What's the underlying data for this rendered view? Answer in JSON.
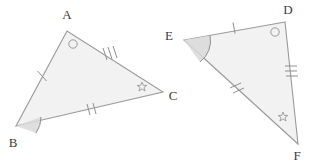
{
  "figure": {
    "background_color": "#ffffff",
    "stroke_color": "#9a9a9a",
    "fill_color": "#f2f2f2",
    "label_color": "#3b3b3b",
    "mark_color": "#9a9a9a"
  },
  "triangles": [
    {
      "id": "triangle-abc",
      "name": "ABC",
      "vertices": [
        {
          "label": "A",
          "x": 67,
          "y": 31,
          "label_x": 67,
          "label_y": 19,
          "angle_mark": "circle",
          "angle_mark_x": 73,
          "angle_mark_y": 44
        },
        {
          "label": "B",
          "x": 16,
          "y": 126,
          "label_x": 13,
          "label_y": 147,
          "angle_mark": "arc-shaded",
          "angle_mark_x": 16,
          "angle_mark_y": 126
        },
        {
          "label": "C",
          "x": 163,
          "y": 92,
          "label_x": 173,
          "label_y": 100,
          "angle_mark": "star",
          "angle_mark_x": 142,
          "angle_mark_y": 87
        }
      ],
      "sides": [
        {
          "from": "A",
          "to": "B",
          "ticks": 1,
          "tick_x": 42,
          "tick_y": 76
        },
        {
          "from": "B",
          "to": "C",
          "ticks": 2,
          "tick_x": 92,
          "tick_y": 110
        },
        {
          "from": "A",
          "to": "C",
          "ticks": 3,
          "tick_x": 110,
          "tick_y": 56
        }
      ]
    },
    {
      "id": "triangle-def",
      "name": "DEF",
      "vertices": [
        {
          "label": "D",
          "x": 285,
          "y": 22,
          "label_x": 288,
          "label_y": 14,
          "angle_mark": "circle",
          "angle_mark_x": 275,
          "angle_mark_y": 32
        },
        {
          "label": "E",
          "x": 184,
          "y": 40,
          "label_x": 169,
          "label_y": 40,
          "angle_mark": "arc-shaded",
          "angle_mark_x": 184,
          "angle_mark_y": 40
        },
        {
          "label": "F",
          "x": 298,
          "y": 144,
          "label_x": 297,
          "label_y": 160,
          "angle_mark": "star",
          "angle_mark_x": 283,
          "angle_mark_y": 117
        }
      ],
      "sides": [
        {
          "from": "E",
          "to": "D",
          "ticks": 1,
          "tick_x": 234,
          "tick_y": 28
        },
        {
          "from": "E",
          "to": "F",
          "ticks": 2,
          "tick_x": 238,
          "tick_y": 89
        },
        {
          "from": "D",
          "to": "F",
          "ticks": 3,
          "tick_x": 291,
          "tick_y": 73
        }
      ]
    }
  ],
  "labels": {
    "a": "A",
    "b": "B",
    "c": "C",
    "d": "D",
    "e": "E",
    "f": "F"
  }
}
